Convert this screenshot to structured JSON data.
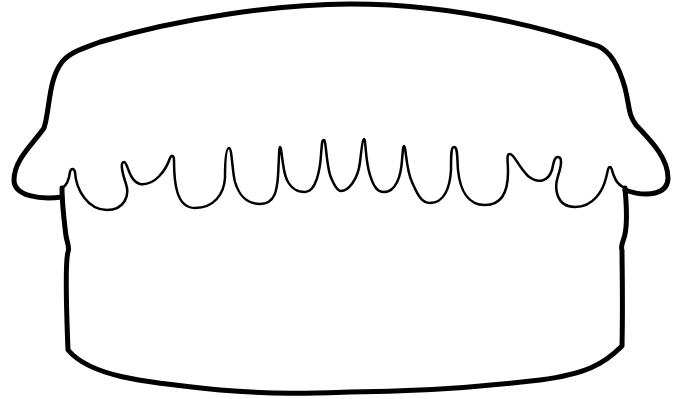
{
  "image": {
    "title": "Cake outline coloring page",
    "description": "Black line-art outline of a single-tier cake with frosting drips",
    "colors": {
      "background": "#ffffff",
      "stroke": "#000000"
    }
  }
}
